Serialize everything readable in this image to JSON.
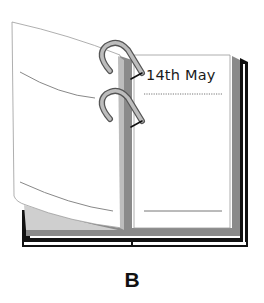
{
  "figure": {
    "date_label": "14th May",
    "caption": "B"
  },
  "colors": {
    "cover": "#111111",
    "page_edge_gray": "#8a8a8a",
    "ring": "#9a9a9a",
    "page": "#ffffff",
    "line": "#777777"
  }
}
